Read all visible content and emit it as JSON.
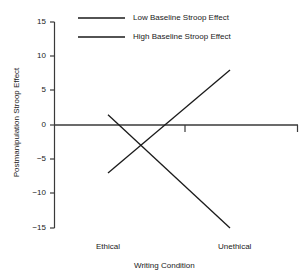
{
  "chart_data": {
    "type": "line",
    "title": "",
    "xlabel": "Writing Condition",
    "ylabel": "Postmanipulation Stroop Effect",
    "categories": [
      "Ethical",
      "Unethical"
    ],
    "ylim": [
      -15,
      15
    ],
    "yticks": [
      15,
      10,
      5,
      0,
      -5,
      -10,
      -15
    ],
    "ytick_labels": [
      "15",
      "10",
      "5",
      "0",
      "−5",
      "−10",
      "−15"
    ],
    "grid": false,
    "legend_position": "top-center",
    "series": [
      {
        "name": "Low Baseline Stroop Effect",
        "values": [
          1.5,
          -15.0
        ],
        "color": "#1a1a1a"
      },
      {
        "name": "High Baseline Stroop Effect",
        "values": [
          -7.0,
          8.0
        ],
        "color": "#1a1a1a"
      }
    ]
  },
  "axis": {
    "y_label": "Postmanipulation Stroop Effect",
    "x_label": "Writing Condition",
    "y_tick_labels": [
      "15",
      "10",
      "5",
      "0",
      "−5",
      "−10",
      "−15"
    ],
    "x_tick_labels": [
      "Ethical",
      "Unethical"
    ]
  },
  "legend": {
    "entries": [
      {
        "label": "Low Baseline Stroop Effect"
      },
      {
        "label": "High Baseline Stroop Effect"
      }
    ]
  },
  "style": {
    "line_color": "#1a1a1a",
    "axis_color": "#3a3a3a",
    "background": "#ffffff"
  }
}
